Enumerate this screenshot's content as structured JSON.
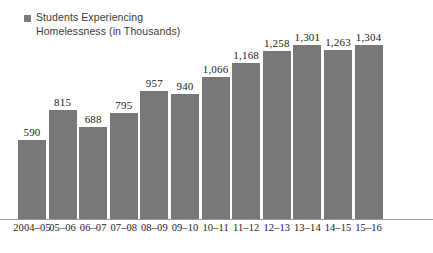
{
  "legend": {
    "label": "Students Experiencing\nHomelessness (in Thousands)",
    "swatch_color": "#7a7a7a",
    "swatch_icon": "square-swatch-icon"
  },
  "colors": {
    "bar_fill": "#787878",
    "baseline": "#9a9a9a",
    "background": "#ffffff",
    "value_text": "#1c1c1c",
    "legend_text": "#3a3a3a"
  },
  "chart_data": {
    "type": "bar",
    "title": "",
    "xlabel": "",
    "ylabel": "",
    "grid": false,
    "legend_position": "top-left",
    "ylim": [
      0,
      1400
    ],
    "categories": [
      "2004–05",
      "05–06",
      "06–07",
      "07–08",
      "08–09",
      "09–10",
      "10–11",
      "11–12",
      "12–13",
      "13–14",
      "14–15",
      "15–16"
    ],
    "series": [
      {
        "name": "Students Experiencing Homelessness (in Thousands)",
        "values": [
          590,
          815,
          688,
          795,
          957,
          940,
          1066,
          1168,
          1258,
          1301,
          1263,
          1304
        ],
        "value_labels": [
          "590",
          "815",
          "688",
          "795",
          "957",
          "940",
          "1,066",
          "1,168",
          "1,258",
          "1,301",
          "1,263",
          "1,304"
        ]
      }
    ]
  }
}
